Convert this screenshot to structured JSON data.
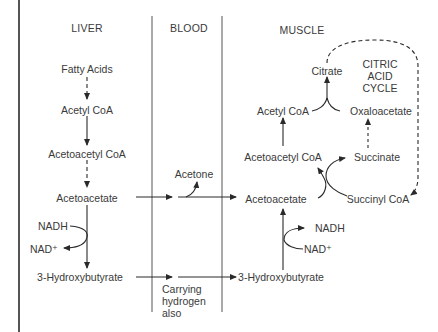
{
  "headers": {
    "liver": "LIVER",
    "blood": "BLOOD",
    "muscle": "MUSCLE"
  },
  "liver": {
    "fatty_acids": "Fatty Acids",
    "acetyl_coa": "Acetyl CoA",
    "acetoacetyl_coa": "Acetoacetyl CoA",
    "acetoacetate": "Acetoacetate",
    "nadh": "NADH",
    "nad": "NAD⁺",
    "hydroxybutyrate": "3-Hydroxybutyrate"
  },
  "blood": {
    "acetone": "Acetone",
    "note": "Carrying\nhydrogen\nalso"
  },
  "muscle": {
    "citrate": "Citrate",
    "cycle_label": "CITRIC\nACID\nCYCLE",
    "acetyl_coa": "Acetyl CoA",
    "oxaloacetate": "Oxaloacetate",
    "acetoacetyl_coa": "Acetoacetyl CoA",
    "succinate": "Succinate",
    "acetoacetate": "Acetoacetate",
    "succinyl_coa": "Succinyl CoA",
    "nadh": "NADH",
    "nad": "NAD⁺",
    "hydroxybutyrate": "3-Hydroxybutyrate"
  },
  "colors": {
    "line": "#2a2a2a",
    "text": "#3a3a3a",
    "background": "#ffffff"
  }
}
